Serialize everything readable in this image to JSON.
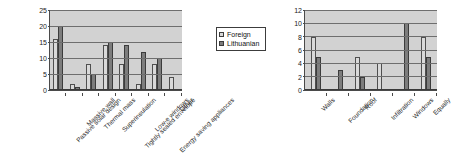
{
  "chart_data": [
    {
      "id": "left",
      "type": "bar",
      "title": "",
      "xlabel": "",
      "ylabel": "",
      "ylim": [
        0,
        25
      ],
      "yticks": [
        0,
        5,
        10,
        15,
        20,
        25
      ],
      "grid": true,
      "legend_position": "right",
      "categories": [
        "Passive solar design",
        "Massive wall",
        "Thermal mass",
        "Superinsulation",
        "Tightly sealed envelope",
        "Low-e windows",
        "Energy saving appliances",
        "Other"
      ],
      "series": [
        {
          "name": "Foreign",
          "color": "#d9d9d9",
          "values": [
            16,
            2,
            8,
            14,
            8,
            2,
            8,
            4
          ]
        },
        {
          "name": "Lithuanian",
          "color": "#7d7d7d",
          "values": [
            20,
            1,
            5,
            15,
            14,
            12,
            10,
            0
          ]
        }
      ]
    },
    {
      "id": "right",
      "type": "bar",
      "title": "",
      "xlabel": "",
      "ylabel": "",
      "ylim": [
        0,
        12
      ],
      "yticks": [
        0,
        2,
        4,
        6,
        8,
        10,
        12
      ],
      "grid": true,
      "legend_position": "none",
      "categories": [
        "Walls",
        "Foundation",
        "Roof",
        "Infiltration",
        "Windows",
        "Equally"
      ],
      "series": [
        {
          "name": "Foreign",
          "color": "#d9d9d9",
          "values": [
            8,
            0,
            5,
            4,
            0,
            8
          ]
        },
        {
          "name": "Lithuanian",
          "color": "#7d7d7d",
          "values": [
            5,
            3,
            2,
            0,
            10,
            5
          ]
        }
      ]
    }
  ],
  "legend": {
    "items": [
      {
        "label": "Foreign"
      },
      {
        "label": "Lithuanian"
      }
    ]
  }
}
